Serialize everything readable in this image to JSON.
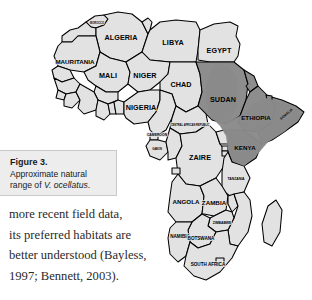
{
  "figure": {
    "caption_title": "Figure 3.",
    "caption_line1": "Approximate natural",
    "caption_line2_prefix": "range of ",
    "caption_species": "V. ocellatus",
    "caption_line2_suffix": "."
  },
  "body": {
    "line1": "more recent field data,",
    "line2": "its preferred habitats are",
    "line3": "better understood (Bayless,",
    "line4": "1997; Bennett, 2003)."
  },
  "map": {
    "title": "Map of Africa showing approximate natural range",
    "colors": {
      "land": "#e2e2e2",
      "range_shade": "#8a8a8a",
      "border": "#000000",
      "background": "#ffffff"
    },
    "labels": {
      "morocco": "MOROCCO",
      "algeria": "ALGERIA",
      "libya": "LIBYA",
      "egypt": "EGYPT",
      "mauritania": "MAURITANIA",
      "mali": "MALI",
      "niger": "NIGER",
      "chad": "CHAD",
      "sudan": "SUDAN",
      "ethiopia": "ETHIOPIA",
      "somalia": "SOMALIA",
      "nigeria": "NIGERIA",
      "cameroon": "CAMEROON",
      "car": "CENTRAL AFRICAN REPUBLIC",
      "gabon": "GABON",
      "zaire": "ZAIRE",
      "kenya": "KENYA",
      "tanzania": "TANZANIA",
      "angola": "ANGOLA",
      "zambia": "ZAMBIA",
      "zimbabwe": "ZIMBABWE",
      "namibia": "NAMIBIA",
      "botswana": "BOTSWANA",
      "south_africa": "SOUTH AFRICA"
    },
    "range_countries": [
      "SUDAN",
      "ETHIOPIA",
      "SOMALIA",
      "KENYA"
    ]
  }
}
